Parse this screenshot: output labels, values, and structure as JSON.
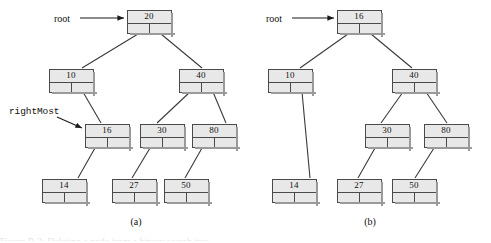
{
  "figure": {
    "width": 491,
    "height": 243,
    "background": "#ffffff",
    "node_fill": "#e8e8e8",
    "node_border": "#4a4a4a",
    "shadow_color": "#9a9a9a",
    "edge_color": "#3a3a3a",
    "footer_text": "Figure B-3: Deleting a node from a binary search tree"
  },
  "panels": [
    {
      "id": "panel-a",
      "caption": "(a)",
      "caption_x": 116,
      "caption_y": 216,
      "pointer_labels": [
        {
          "name": "root",
          "text": "root",
          "x": 54,
          "y": 13,
          "arrow": {
            "x1": 80,
            "y1": 18,
            "x2": 124,
            "y2": 18
          },
          "style": "serif"
        },
        {
          "name": "rightMost",
          "text": "rightMost",
          "x": 9,
          "y": 106,
          "arrow": {
            "x1": 57,
            "y1": 117,
            "x2": 82,
            "y2": 128
          },
          "style": "mono"
        }
      ],
      "nodes": [
        {
          "id": "a-20",
          "value": "20",
          "x": 127,
          "y": 10
        },
        {
          "id": "a-10",
          "value": "10",
          "x": 49,
          "y": 69
        },
        {
          "id": "a-40",
          "value": "40",
          "x": 179,
          "y": 69
        },
        {
          "id": "a-16",
          "value": "16",
          "x": 85,
          "y": 124
        },
        {
          "id": "a-30",
          "value": "30",
          "x": 140,
          "y": 124
        },
        {
          "id": "a-80",
          "value": "80",
          "x": 192,
          "y": 124
        },
        {
          "id": "a-14",
          "value": "14",
          "x": 42,
          "y": 179
        },
        {
          "id": "a-27",
          "value": "27",
          "x": 112,
          "y": 179
        },
        {
          "id": "a-50",
          "value": "50",
          "x": 164,
          "y": 179
        }
      ],
      "edges": [
        {
          "from": "a-20",
          "slot": "left",
          "x1": 138,
          "y1": 34,
          "x2": 82,
          "y2": 68
        },
        {
          "from": "a-20",
          "slot": "right",
          "x1": 161,
          "y1": 34,
          "x2": 202,
          "y2": 68
        },
        {
          "from": "a-10",
          "slot": "right",
          "x1": 83,
          "y1": 92,
          "x2": 101,
          "y2": 123
        },
        {
          "from": "a-40",
          "slot": "left",
          "x1": 190,
          "y1": 92,
          "x2": 157,
          "y2": 123
        },
        {
          "from": "a-40",
          "slot": "right",
          "x1": 213,
          "y1": 92,
          "x2": 226,
          "y2": 123
        },
        {
          "from": "a-16",
          "slot": "left",
          "x1": 95,
          "y1": 148,
          "x2": 78,
          "y2": 178
        },
        {
          "from": "a-30",
          "slot": "left",
          "x1": 150,
          "y1": 148,
          "x2": 132,
          "y2": 178
        },
        {
          "from": "a-80",
          "slot": "left",
          "x1": 202,
          "y1": 148,
          "x2": 185,
          "y2": 178
        }
      ]
    },
    {
      "id": "panel-b",
      "caption": "(b)",
      "caption_x": 350,
      "caption_y": 216,
      "pointer_labels": [
        {
          "name": "root",
          "text": "root",
          "x": 266,
          "y": 13,
          "arrow": {
            "x1": 292,
            "y1": 18,
            "x2": 334,
            "y2": 18
          },
          "style": "serif"
        }
      ],
      "nodes": [
        {
          "id": "b-16",
          "value": "16",
          "x": 337,
          "y": 10
        },
        {
          "id": "b-10",
          "value": "10",
          "x": 268,
          "y": 69
        },
        {
          "id": "b-40",
          "value": "40",
          "x": 392,
          "y": 69
        },
        {
          "id": "b-30",
          "value": "30",
          "x": 365,
          "y": 124
        },
        {
          "id": "b-80",
          "value": "80",
          "x": 424,
          "y": 124
        },
        {
          "id": "b-14",
          "value": "14",
          "x": 272,
          "y": 179
        },
        {
          "id": "b-27",
          "value": "27",
          "x": 337,
          "y": 179
        },
        {
          "id": "b-50",
          "value": "50",
          "x": 392,
          "y": 179
        }
      ],
      "edges": [
        {
          "from": "b-16",
          "slot": "left",
          "x1": 348,
          "y1": 34,
          "x2": 300,
          "y2": 68
        },
        {
          "from": "b-16",
          "slot": "right",
          "x1": 371,
          "y1": 34,
          "x2": 412,
          "y2": 68
        },
        {
          "from": "b-10",
          "slot": "right",
          "x1": 302,
          "y1": 92,
          "x2": 310,
          "y2": 178
        },
        {
          "from": "b-40",
          "slot": "left",
          "x1": 403,
          "y1": 92,
          "x2": 381,
          "y2": 123
        },
        {
          "from": "b-40",
          "slot": "right",
          "x1": 426,
          "y1": 92,
          "x2": 447,
          "y2": 123
        },
        {
          "from": "b-30",
          "slot": "left",
          "x1": 375,
          "y1": 148,
          "x2": 358,
          "y2": 178
        },
        {
          "from": "b-80",
          "slot": "left",
          "x1": 434,
          "y1": 148,
          "x2": 415,
          "y2": 178
        }
      ]
    }
  ]
}
